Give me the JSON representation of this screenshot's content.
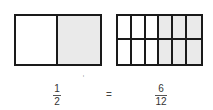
{
  "diagram": {
    "left_shape": {
      "columns": 2,
      "rows": 1,
      "shaded": [
        false,
        true
      ],
      "fill_shaded": "#eaeaea",
      "fill_empty": "#ffffff"
    },
    "right_shape": {
      "columns": 6,
      "rows": 2,
      "shaded": [
        false,
        false,
        false,
        true,
        true,
        true,
        false,
        false,
        false,
        true,
        true,
        true
      ],
      "fill_shaded": "#eaeaea",
      "fill_empty": "#ffffff"
    },
    "left_fraction": {
      "numerator": "1",
      "denominator": "2"
    },
    "equals": "=",
    "right_fraction": {
      "numerator": "6",
      "denominator": "12"
    },
    "stray_mark": "ᶦ"
  }
}
